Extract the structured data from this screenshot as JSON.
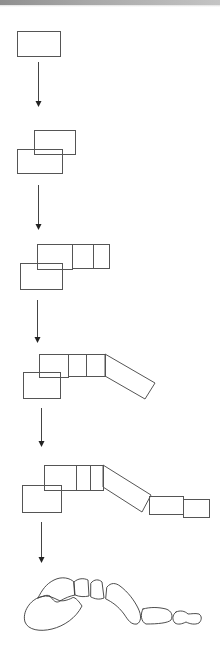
{
  "diagram": {
    "colors": {
      "background": "#ffffff",
      "stroke": "#555555",
      "arrow": "#222222",
      "top_bar_start": "#8f8f8f",
      "top_bar_end": "#c4c4c4"
    },
    "stages": [
      {
        "id": "stage-1",
        "label": "Stage 1: single block",
        "rects": [
          {
            "x": 17,
            "y": 31,
            "w": 43,
            "h": 25
          }
        ],
        "polygons": []
      },
      {
        "id": "stage-2",
        "label": "Stage 2: two overlapping blocks",
        "rects": [
          {
            "x": 34,
            "y": 130,
            "w": 41,
            "h": 24
          },
          {
            "x": 17,
            "y": 149,
            "w": 45,
            "h": 24
          }
        ],
        "polygons": []
      },
      {
        "id": "stage-3",
        "label": "Stage 3: row of blocks added",
        "rects": [
          {
            "x": 37,
            "y": 244,
            "w": 35,
            "h": 25
          },
          {
            "x": 72,
            "y": 244,
            "w": 21,
            "h": 24
          },
          {
            "x": 93,
            "y": 244,
            "w": 16,
            "h": 24
          },
          {
            "x": 20,
            "y": 263,
            "w": 42,
            "h": 26
          }
        ],
        "polygons": []
      },
      {
        "id": "stage-4",
        "label": "Stage 4: angled block added",
        "rects": [
          {
            "x": 39,
            "y": 354,
            "w": 29,
            "h": 23
          },
          {
            "x": 68,
            "y": 354,
            "w": 18,
            "h": 22
          },
          {
            "x": 86,
            "y": 354,
            "w": 19,
            "h": 22
          },
          {
            "x": 23,
            "y": 372,
            "w": 37,
            "h": 26
          }
        ],
        "polygons": [
          {
            "points": "105,354 155,383 145,399 105,376"
          }
        ]
      },
      {
        "id": "stage-5",
        "label": "Stage 5: distal blocks added",
        "rects": [
          {
            "x": 44,
            "y": 465,
            "w": 32,
            "h": 25
          },
          {
            "x": 76,
            "y": 465,
            "w": 14,
            "h": 25
          },
          {
            "x": 90,
            "y": 465,
            "w": 13,
            "h": 25
          },
          {
            "x": 22,
            "y": 485,
            "w": 39,
            "h": 27
          },
          {
            "x": 149,
            "y": 496,
            "w": 34,
            "h": 18
          },
          {
            "x": 183,
            "y": 499,
            "w": 26,
            "h": 18
          }
        ],
        "polygons": [
          {
            "points": "103,465 151,495 142,512 103,487"
          }
        ]
      },
      {
        "id": "stage-6",
        "label": "Stage 6: foot skeleton outline",
        "bones": [
          {
            "name": "calcaneus",
            "d": "M 40,597 C 30,600 22,612 25,622 C 28,630 40,632 52,629 C 64,626 76,618 82,606 C 78,600 74,596 72,598 C 68,600 62,602 58,600 C 54,598 50,596 46,596 Z"
          },
          {
            "name": "talus",
            "d": "M 38,598 C 42,590 46,584 54,580 C 62,576 70,578 74,582 L 75,595 C 70,596 65,598 60,601 C 56,604 53,600 50,596 C 46,594 42,597 38,598 Z"
          },
          {
            "name": "navicular",
            "d": "M 74,582 C 78,578 84,578 88,580 L 89,596 C 84,597 80,597 75,595 Z"
          },
          {
            "name": "cuneiform",
            "d": "M 91,583 C 94,579 99,579 102,582 L 104,598 C 99,600 95,599 91,597 Z"
          },
          {
            "name": "metatarsal",
            "d": "M 107,587 C 111,582 116,583 120,586 C 128,592 134,600 138,608 C 142,616 141,622 137,624 C 131,625 128,620 124,614 C 118,606 112,602 106,599 Z"
          },
          {
            "name": "proximal-phalanx",
            "d": "M 143,609 C 150,607 158,607 166,609 C 172,611 173,616 171,620 C 168,623 158,624 146,624 C 141,622 140,614 143,609 Z"
          },
          {
            "name": "distal-phalanx",
            "d": "M 176,612 C 180,610 185,611 188,614 C 191,614 195,613 199,614 C 202,616 202,620 199,623 C 195,625 190,624 186,622 C 182,624 178,625 175,623 C 172,620 172,615 176,612 Z"
          }
        ]
      }
    ],
    "arrows": [
      {
        "x": 38,
        "y1": 62,
        "y2": 107
      },
      {
        "x": 38,
        "y1": 185,
        "y2": 230
      },
      {
        "x": 37,
        "y1": 300,
        "y2": 343
      },
      {
        "x": 41,
        "y1": 408,
        "y2": 447
      },
      {
        "x": 41,
        "y1": 522,
        "y2": 563
      }
    ]
  }
}
